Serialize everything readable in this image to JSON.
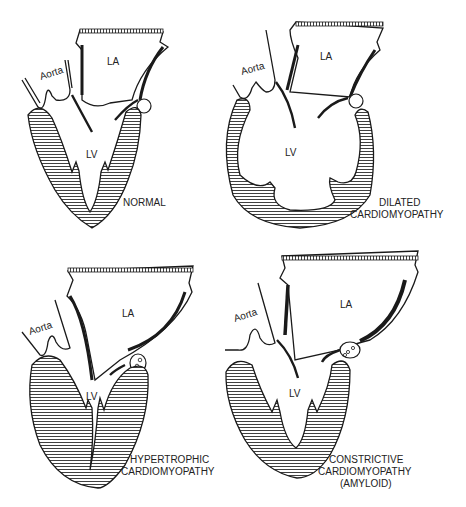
{
  "figure": {
    "panels": [
      {
        "id": "normal",
        "title": [
          "NORMAL"
        ],
        "labels": {
          "aorta": "Aorta",
          "la": "LA",
          "lv": "LV"
        }
      },
      {
        "id": "dilated",
        "title": [
          "DILATED",
          "CARDIOMYOPATHY"
        ],
        "labels": {
          "aorta": "Aorta",
          "la": "LA",
          "lv": "LV"
        }
      },
      {
        "id": "hypertrophic",
        "title": [
          "HYPERTROPHIC",
          "CARDIOMYOPATHY"
        ],
        "labels": {
          "aorta": "Aorta",
          "la": "LA",
          "lv": "LV"
        }
      },
      {
        "id": "constrictive",
        "title": [
          "CONSTRICTIVE",
          "CARDIOMYOPATHY",
          "(AMYLOID)"
        ],
        "labels": {
          "aorta": "Aorta",
          "la": "LA",
          "lv": "LV"
        }
      }
    ],
    "colors": {
      "line": "#1a1a1a",
      "background": "#ffffff",
      "hatch": "#2a2a2a"
    }
  }
}
